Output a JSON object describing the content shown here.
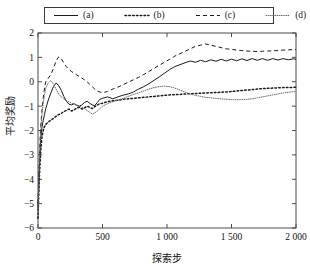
{
  "legend": {
    "position": "top",
    "entries": [
      {
        "key": "a",
        "label": "(a)",
        "style": "solid",
        "icon": "line-solid-icon"
      },
      {
        "key": "b",
        "label": "(b)",
        "style": "dashdot",
        "icon": "line-dashdot-icon"
      },
      {
        "key": "c",
        "label": "(c)",
        "style": "dashed",
        "icon": "line-dashed-icon"
      },
      {
        "key": "d",
        "label": "(d)",
        "style": "dotted",
        "icon": "line-dotted-icon"
      }
    ]
  },
  "axes": {
    "xlabel": "探索步",
    "ylabel": "平均奖励",
    "xticks": [
      "0",
      "500",
      "1 000",
      "1 500",
      "2 000"
    ],
    "yticks": [
      "2",
      "1",
      "0",
      "-1",
      "-2",
      "-3",
      "-4",
      "-5",
      "-6"
    ]
  },
  "chart_data": {
    "type": "line",
    "title": "",
    "xlabel": "探索步",
    "ylabel": "平均奖励",
    "xlim": [
      0,
      2000
    ],
    "ylim": [
      -6,
      2
    ],
    "xticks": [
      0,
      500,
      1000,
      1500,
      2000
    ],
    "yticks": [
      -6,
      -5,
      -4,
      -3,
      -2,
      -1,
      0,
      1,
      2
    ],
    "grid": false,
    "legend_position": "top",
    "x": [
      0,
      10,
      20,
      30,
      40,
      50,
      60,
      80,
      100,
      120,
      140,
      160,
      180,
      200,
      220,
      240,
      260,
      280,
      300,
      320,
      340,
      360,
      380,
      400,
      420,
      440,
      460,
      480,
      500,
      540,
      580,
      620,
      660,
      700,
      740,
      780,
      820,
      860,
      900,
      940,
      980,
      1020,
      1060,
      1100,
      1140,
      1180,
      1220,
      1260,
      1300,
      1340,
      1380,
      1420,
      1460,
      1500,
      1540,
      1580,
      1620,
      1660,
      1700,
      1740,
      1780,
      1820,
      1860,
      1900,
      1940,
      1980,
      2000
    ],
    "series": [
      {
        "name": "(a)",
        "style": "solid",
        "color": "#1a1a1a",
        "values": [
          -5.2,
          -3.6,
          -2.4,
          -1.9,
          -1.6,
          -1.35,
          -1.1,
          -0.75,
          -0.45,
          -0.2,
          -0.05,
          -0.15,
          -0.35,
          -0.6,
          -0.8,
          -0.92,
          -0.95,
          -0.9,
          -0.98,
          -1.0,
          -0.95,
          -0.85,
          -0.8,
          -0.88,
          -0.95,
          -0.98,
          -0.85,
          -0.72,
          -0.68,
          -0.62,
          -0.7,
          -0.62,
          -0.55,
          -0.5,
          -0.42,
          -0.3,
          -0.2,
          -0.08,
          0.06,
          0.2,
          0.35,
          0.5,
          0.62,
          0.7,
          0.78,
          0.85,
          0.8,
          0.88,
          0.82,
          0.9,
          0.84,
          0.92,
          0.85,
          0.93,
          0.86,
          0.94,
          0.87,
          0.95,
          0.88,
          0.95,
          0.88,
          0.95,
          0.89,
          0.95,
          0.9,
          0.94,
          0.92
        ]
      },
      {
        "name": "(b)",
        "style": "dashdot",
        "color": "#1a1a1a",
        "values": [
          -5.6,
          -4.0,
          -2.9,
          -2.3,
          -2.0,
          -1.85,
          -1.75,
          -1.65,
          -1.58,
          -1.5,
          -1.42,
          -1.35,
          -1.3,
          -1.22,
          -1.18,
          -1.12,
          -1.2,
          -1.15,
          -1.08,
          -1.05,
          -1.12,
          -1.08,
          -1.0,
          -1.05,
          -1.1,
          -1.02,
          -0.95,
          -0.9,
          -0.88,
          -0.82,
          -0.78,
          -0.76,
          -0.72,
          -0.7,
          -0.68,
          -0.66,
          -0.64,
          -0.62,
          -0.6,
          -0.58,
          -0.56,
          -0.54,
          -0.53,
          -0.52,
          -0.5,
          -0.49,
          -0.48,
          -0.47,
          -0.46,
          -0.45,
          -0.44,
          -0.43,
          -0.42,
          -0.4,
          -0.38,
          -0.36,
          -0.34,
          -0.32,
          -0.3,
          -0.28,
          -0.27,
          -0.26,
          -0.25,
          -0.24,
          -0.24,
          -0.23,
          -0.23
        ]
      },
      {
        "name": "(c)",
        "style": "dashed",
        "color": "#1a1a1a",
        "values": [
          -5.0,
          -3.2,
          -1.9,
          -1.2,
          -0.7,
          -0.3,
          0.0,
          0.15,
          0.3,
          0.55,
          0.85,
          1.02,
          0.95,
          0.78,
          0.62,
          0.5,
          0.42,
          0.35,
          0.28,
          0.22,
          0.15,
          0.08,
          0.0,
          -0.1,
          -0.2,
          -0.3,
          -0.38,
          -0.42,
          -0.45,
          -0.4,
          -0.3,
          -0.22,
          -0.12,
          -0.02,
          0.08,
          0.18,
          0.3,
          0.42,
          0.55,
          0.68,
          0.8,
          0.92,
          1.05,
          1.15,
          1.25,
          1.35,
          1.45,
          1.5,
          1.55,
          1.5,
          1.45,
          1.4,
          1.35,
          1.33,
          1.3,
          1.28,
          1.26,
          1.25,
          1.24,
          1.25,
          1.26,
          1.27,
          1.28,
          1.3,
          1.31,
          1.32,
          1.32
        ]
      },
      {
        "name": "(d)",
        "style": "dotted",
        "color": "#6e6e6e",
        "values": [
          -5.4,
          -3.4,
          -2.1,
          -1.4,
          -0.9,
          -0.55,
          -0.25,
          -0.05,
          0.05,
          -0.1,
          -0.3,
          -0.5,
          -0.62,
          -0.7,
          -0.78,
          -0.82,
          -0.88,
          -0.9,
          -0.95,
          -1.0,
          -1.05,
          -1.1,
          -1.18,
          -1.25,
          -1.32,
          -1.28,
          -1.2,
          -1.1,
          -1.0,
          -0.9,
          -0.82,
          -0.75,
          -0.68,
          -0.6,
          -0.52,
          -0.45,
          -0.38,
          -0.3,
          -0.24,
          -0.2,
          -0.18,
          -0.2,
          -0.26,
          -0.34,
          -0.42,
          -0.5,
          -0.56,
          -0.6,
          -0.64,
          -0.66,
          -0.68,
          -0.7,
          -0.72,
          -0.73,
          -0.74,
          -0.73,
          -0.72,
          -0.7,
          -0.66,
          -0.62,
          -0.58,
          -0.54,
          -0.5,
          -0.46,
          -0.43,
          -0.41,
          -0.4
        ]
      }
    ]
  }
}
